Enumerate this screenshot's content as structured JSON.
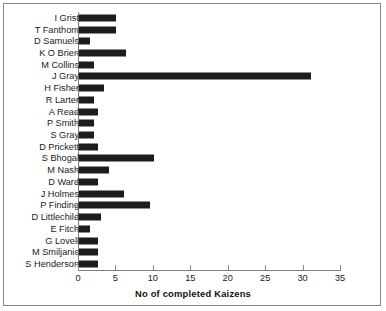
{
  "chart_data": {
    "type": "bar",
    "orientation": "horizontal",
    "title": "",
    "xlabel": "No of completed Kaizens",
    "ylabel": "",
    "xlim": [
      0,
      35
    ],
    "xticks": [
      0,
      5,
      10,
      15,
      20,
      25,
      30,
      35
    ],
    "grid": false,
    "legend": null,
    "bar_color": "#1c1c1c",
    "categories": [
      "I Grist",
      "T Fanthom",
      "D Samuels",
      "K O Brien",
      "M Collins",
      "J Gray",
      "H Fisher",
      "R Larter",
      "A Read",
      "P Smith",
      "S Gray",
      "D Prickett",
      "S Bhogal",
      "M Nash",
      "D Ward",
      "J Holmes",
      "P Finding",
      "D Littlechild",
      "E Fitch",
      "G Lovell",
      "M Smiljanic",
      "S Henderson"
    ],
    "values": [
      5,
      5,
      1.5,
      6.3,
      2,
      31,
      3.3,
      2,
      2.5,
      2,
      2,
      2.5,
      10,
      4,
      2.5,
      6,
      9.5,
      3,
      1.5,
      2.5,
      2.5,
      2.5
    ]
  }
}
